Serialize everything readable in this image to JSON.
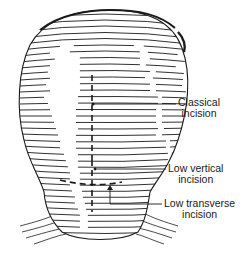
{
  "diagram": {
    "labels": [
      {
        "id": "classical",
        "line1": "Classical",
        "line2": "incision"
      },
      {
        "id": "low_vertical",
        "line1": "Low vertical",
        "line2": "incision"
      },
      {
        "id": "low_transverse",
        "line1": "Low transverse",
        "line2": "incision"
      }
    ],
    "colors": {
      "ink": "#1a1a1a",
      "background": "#ffffff"
    }
  }
}
